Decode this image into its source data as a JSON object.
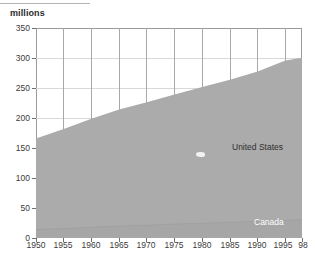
{
  "axis_title": "millions",
  "labels": {
    "united_states": "United States",
    "canada": "Canada"
  },
  "colors": {
    "area_fill": "#ababab",
    "frame": "#9a9a9a",
    "grid_horizontal": "#d8d8d8",
    "grid_vertical": "#a8a8a8",
    "text": "#3b3b3b",
    "canada_label_text": "#ffffff",
    "background": "#ffffff"
  },
  "chart_data": {
    "type": "area",
    "title": "",
    "subtitle": "",
    "xlabel": "",
    "ylabel": "millions",
    "ylim": [
      0,
      350
    ],
    "xlim": [
      1950,
      1998
    ],
    "grid": true,
    "legend_position": "inline-annotation",
    "stacked": true,
    "ytick_labels": [
      "0",
      "50",
      "100",
      "150",
      "200",
      "250",
      "300",
      "350"
    ],
    "yticks": [
      0,
      50,
      100,
      150,
      200,
      250,
      300,
      350
    ],
    "xtick_labels": [
      "1950",
      "1955",
      "1960",
      "1965",
      "1970",
      "1975",
      "1980",
      "1985",
      "1990",
      "1995",
      "98"
    ],
    "xticks": [
      1950,
      1955,
      1960,
      1965,
      1970,
      1975,
      1980,
      1985,
      1990,
      1995,
      1998
    ],
    "x": [
      1950,
      1955,
      1960,
      1965,
      1970,
      1975,
      1980,
      1985,
      1990,
      1995,
      1998
    ],
    "series": [
      {
        "name": "Canada",
        "values": [
          13.7,
          15.7,
          17.9,
          19.7,
          21.3,
          23.1,
          24.6,
          26.0,
          27.8,
          29.4,
          30.3
        ]
      },
      {
        "name": "United States",
        "values": [
          152.3,
          165.9,
          180.7,
          194.3,
          205.1,
          216.0,
          227.2,
          237.9,
          249.6,
          266.3,
          270.3
        ]
      }
    ],
    "totals": [
      166.0,
      181.6,
      198.6,
      214.0,
      226.4,
      239.1,
      251.8,
      263.9,
      277.4,
      295.7,
      300.6
    ],
    "annotations": [
      {
        "text": "United States",
        "x": 1986,
        "y": 165
      },
      {
        "text": "Canada",
        "x": 1994,
        "y": 18
      }
    ]
  }
}
